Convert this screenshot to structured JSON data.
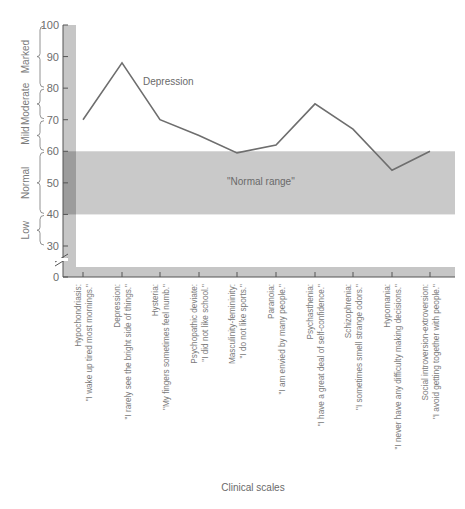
{
  "chart_data": {
    "type": "line",
    "title": "",
    "xlabel": "Clinical scales",
    "ylabel": "",
    "ylim": [
      0,
      100
    ],
    "yticks": [
      0,
      30,
      40,
      50,
      60,
      70,
      80,
      90,
      100
    ],
    "axis_break": "between 0 and 30",
    "grid": false,
    "legend": null,
    "categories": [
      {
        "scale": "Hypochondriasis:",
        "item": "\"I wake up tired most mornings.\""
      },
      {
        "scale": "Depression:",
        "item": "\"I rarely see the bright side of things.\""
      },
      {
        "scale": "Hysteria:",
        "item": "\"My fingers sometimes feel numb.\""
      },
      {
        "scale": "Psychopathic deviate:",
        "item": "\"I did not like school.\""
      },
      {
        "scale": "Masculinity-femininity:",
        "item": "\"I do not like sports.\""
      },
      {
        "scale": "Paranoia:",
        "item": "\"I am envied by many people.\""
      },
      {
        "scale": "Psychasthenia:",
        "item": "\"I have a great deal of self-confidence.\""
      },
      {
        "scale": "Schizophrenia:",
        "item": "\"I sometimes smell strange odors.\""
      },
      {
        "scale": "Hypomania:",
        "item": "\"I never have any difficulty making decisions.\""
      },
      {
        "scale": "Social introversion-extroversion:",
        "item": "\"I avoid getting together with people.\""
      }
    ],
    "series": [
      {
        "name": "Profile",
        "values": [
          70,
          88,
          70,
          65,
          59.5,
          62,
          75,
          67,
          54,
          60
        ]
      }
    ],
    "annotations": [
      {
        "text": "Depression",
        "near": "Depression peak"
      },
      {
        "text": "\"Normal range\"",
        "region": [
          40,
          60
        ]
      }
    ],
    "bands": [
      {
        "label": "Marked",
        "range": [
          80,
          100
        ]
      },
      {
        "label": "Moderate",
        "range": [
          70,
          80
        ]
      },
      {
        "label": "Mild",
        "range": [
          60,
          70
        ]
      },
      {
        "label": "Normal",
        "range": [
          40,
          60
        ]
      },
      {
        "label": "Low",
        "range": [
          30,
          40
        ]
      }
    ],
    "colors": {
      "line": "#6e6e6e",
      "normal_band": "#c9c9c9",
      "axis_strip": "#c6c6c6",
      "axis_strip_dark": "#9c9c9c"
    }
  }
}
